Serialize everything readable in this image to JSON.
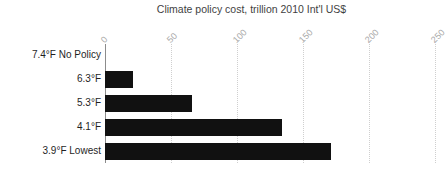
{
  "chart_data": {
    "type": "bar",
    "orientation": "horizontal",
    "title": "Climate policy cost, trillion 2010 Int'l US$",
    "xlabel": "",
    "ylabel": "",
    "categories": [
      "7.4°F No Policy",
      "6.3°F",
      "5.3°F",
      "4.1°F",
      "3.9°F Lowest"
    ],
    "values": [
      0,
      21,
      66,
      134,
      171
    ],
    "xlim": [
      0,
      250
    ],
    "xticks": [
      0,
      50,
      100,
      150,
      200,
      250
    ],
    "xtick_labels": [
      "0",
      "50",
      "100",
      "150",
      "200",
      "250"
    ],
    "xtick_rotation": -45,
    "grid": "vertical-dotted",
    "legend": "none",
    "bar_color": "#111111",
    "gridline_color": "#cfcfcf",
    "axis_color": "#8c8c8c",
    "tick_label_color": "#a8a8a8",
    "title_color": "#3f3f3f",
    "category_label_color": "#1f1f1f",
    "background": "#ffffff"
  }
}
